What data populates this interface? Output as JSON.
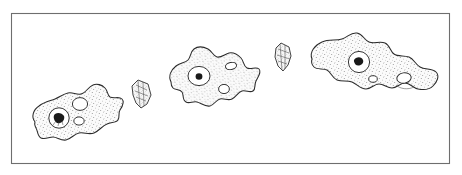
{
  "figure": {
    "caption": "",
    "background_color": "#ffffff",
    "frame": {
      "name": "illustration-border",
      "x": 11,
      "y": 13,
      "width": 438,
      "height": 150,
      "stroke_color": "#6e6e6e",
      "stroke_width": 1.1,
      "fill_color": "#ffffff"
    },
    "ink_color": "#2b2b2b",
    "stipple_color": "#8b8b8b",
    "cytoplasm_fill": "#f2f2f2"
  },
  "chart_data": {
    "type": "diagram",
    "subtitle": "",
    "xlabel": "",
    "ylabel": "",
    "legend": [],
    "annotations": [],
    "series": [
      {
        "name": "amoebae",
        "values": [
          {
            "label": "amoeba-stage-1",
            "position": "left",
            "center_x": 78,
            "center_y": 117,
            "width": 92,
            "height": 60,
            "nucleus_count": 1,
            "vacuole_count": 3
          },
          {
            "label": "amoeba-stage-2",
            "position": "center",
            "center_x": 212,
            "center_y": 74,
            "width": 92,
            "height": 62,
            "nucleus_count": 1,
            "vacuole_count": 2
          },
          {
            "label": "amoeba-stage-3",
            "position": "right",
            "center_x": 368,
            "center_y": 63,
            "width": 125,
            "height": 60,
            "nucleus_count": 1,
            "vacuole_count": 3
          }
        ]
      },
      {
        "name": "prey-organisms",
        "values": [
          {
            "label": "prey-organism-1",
            "position": "left-gap",
            "center_x": 141,
            "center_y": 93,
            "width": 22,
            "height": 30
          },
          {
            "label": "prey-organism-2",
            "position": "right-gap",
            "center_x": 282,
            "center_y": 57,
            "width": 20,
            "height": 28
          }
        ]
      }
    ]
  },
  "labels": {
    "amoeba_1": "",
    "amoeba_2": "",
    "amoeba_3": "",
    "prey_1": "",
    "prey_2": ""
  }
}
